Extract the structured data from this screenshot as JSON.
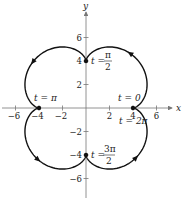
{
  "figure": {
    "type": "parametric-curve",
    "curve": {
      "x": "5cos t - cos 5t",
      "y": "5sin t - sin 5t",
      "t_range": [
        0,
        6.283185
      ]
    },
    "axes": {
      "x_label": "x",
      "y_label": "y",
      "x_ticks": [
        "-6",
        "-4",
        "-2",
        "2",
        "4",
        "6"
      ],
      "y_ticks": [
        "6",
        "4",
        "2",
        "-2",
        "-4",
        "-6"
      ]
    },
    "annotations": {
      "t0": "t = 0",
      "t2pi": "t = 2π",
      "tpi": "t = π",
      "tpi2_t": "t =",
      "tpi2_num": "π",
      "tpi2_den": "2",
      "t3pi2_t": "t =",
      "t3pi2_num": "3π",
      "t3pi2_den": "2"
    },
    "points": [
      {
        "label": "t=0 / t=2π",
        "x": 4,
        "y": 0
      },
      {
        "label": "t=π/2",
        "x": 0,
        "y": 4
      },
      {
        "label": "t=π",
        "x": -4,
        "y": 0
      },
      {
        "label": "t=3π/2",
        "x": 0,
        "y": -4
      }
    ],
    "colors": {
      "curve": "#111111",
      "axis": "#777777"
    }
  }
}
